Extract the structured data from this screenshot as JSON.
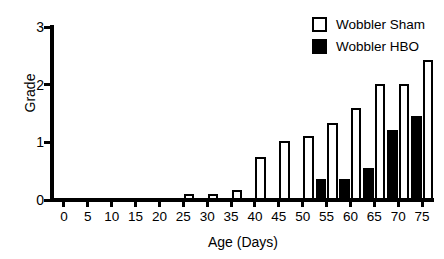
{
  "chart_data": {
    "type": "bar",
    "title": "",
    "xlabel": "Age (Days)",
    "ylabel": "Grade",
    "xlim": [
      -2.5,
      77.5
    ],
    "ylim": [
      0,
      3
    ],
    "yticks": [
      0,
      1,
      2,
      3
    ],
    "xticks": [
      0,
      5,
      10,
      15,
      20,
      25,
      30,
      35,
      40,
      45,
      50,
      55,
      60,
      65,
      70,
      75
    ],
    "categories": [
      0,
      5,
      10,
      15,
      20,
      25,
      30,
      35,
      40,
      45,
      50,
      55,
      60,
      65,
      70,
      75
    ],
    "grid": false,
    "legend_position": "top-right",
    "series": [
      {
        "name": "Wobbler Sham",
        "color": "#ffffff",
        "edge_color": "#000000",
        "values": [
          0,
          0,
          0,
          0,
          0,
          0.11,
          0.11,
          0.18,
          0.75,
          1.02,
          1.11,
          1.33,
          1.6,
          2.02,
          2.02,
          2.42
        ]
      },
      {
        "name": "Wobbler HBO",
        "color": "#000000",
        "edge_color": "#000000",
        "values": [
          0,
          0,
          0,
          0,
          0,
          0,
          0,
          0,
          0,
          0,
          0,
          0.36,
          0.36,
          0.55,
          1.22,
          1.45
        ]
      }
    ]
  },
  "axes": {
    "y_title": "Grade",
    "x_title": "Age (Days)",
    "y_tick_labels": [
      "0",
      "1",
      "2",
      "3"
    ],
    "x_tick_labels": [
      "0",
      "5",
      "10",
      "15",
      "20",
      "25",
      "30",
      "35",
      "40",
      "45",
      "50",
      "55",
      "60",
      "65",
      "70",
      "75"
    ]
  },
  "legend": {
    "items": [
      {
        "label": "Wobbler Sham",
        "swatch": "open-square-swatch"
      },
      {
        "label": "Wobbler HBO",
        "swatch": "filled-square-swatch"
      }
    ]
  }
}
